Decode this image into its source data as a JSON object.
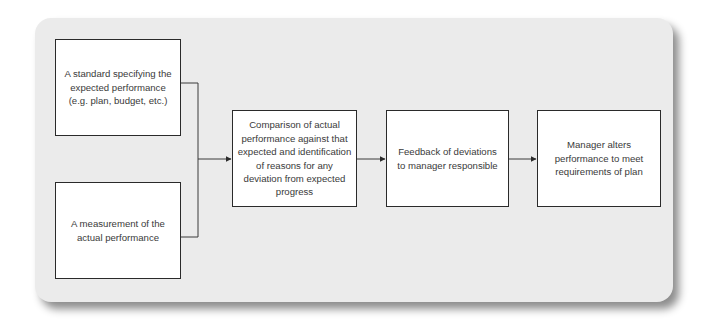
{
  "diagram": {
    "type": "flowchart",
    "background_color": "#ebebeb",
    "box_border_color": "#2a2a2a",
    "nodes": [
      {
        "id": "standard",
        "label": "A standard specifying the expected performance (e.g. plan, budget, etc.)"
      },
      {
        "id": "measurement",
        "label": "A measurement of the actual performance"
      },
      {
        "id": "comparison",
        "label": "Comparison of actual performance against that expected and identification of reasons for any deviation from expected progress"
      },
      {
        "id": "feedback",
        "label": "Feedback of deviations to manager responsible"
      },
      {
        "id": "manager",
        "label": "Manager alters performance to meet requirements of plan"
      }
    ],
    "edges": [
      {
        "from": "standard",
        "to": "comparison"
      },
      {
        "from": "measurement",
        "to": "comparison"
      },
      {
        "from": "comparison",
        "to": "feedback"
      },
      {
        "from": "feedback",
        "to": "manager"
      }
    ]
  }
}
